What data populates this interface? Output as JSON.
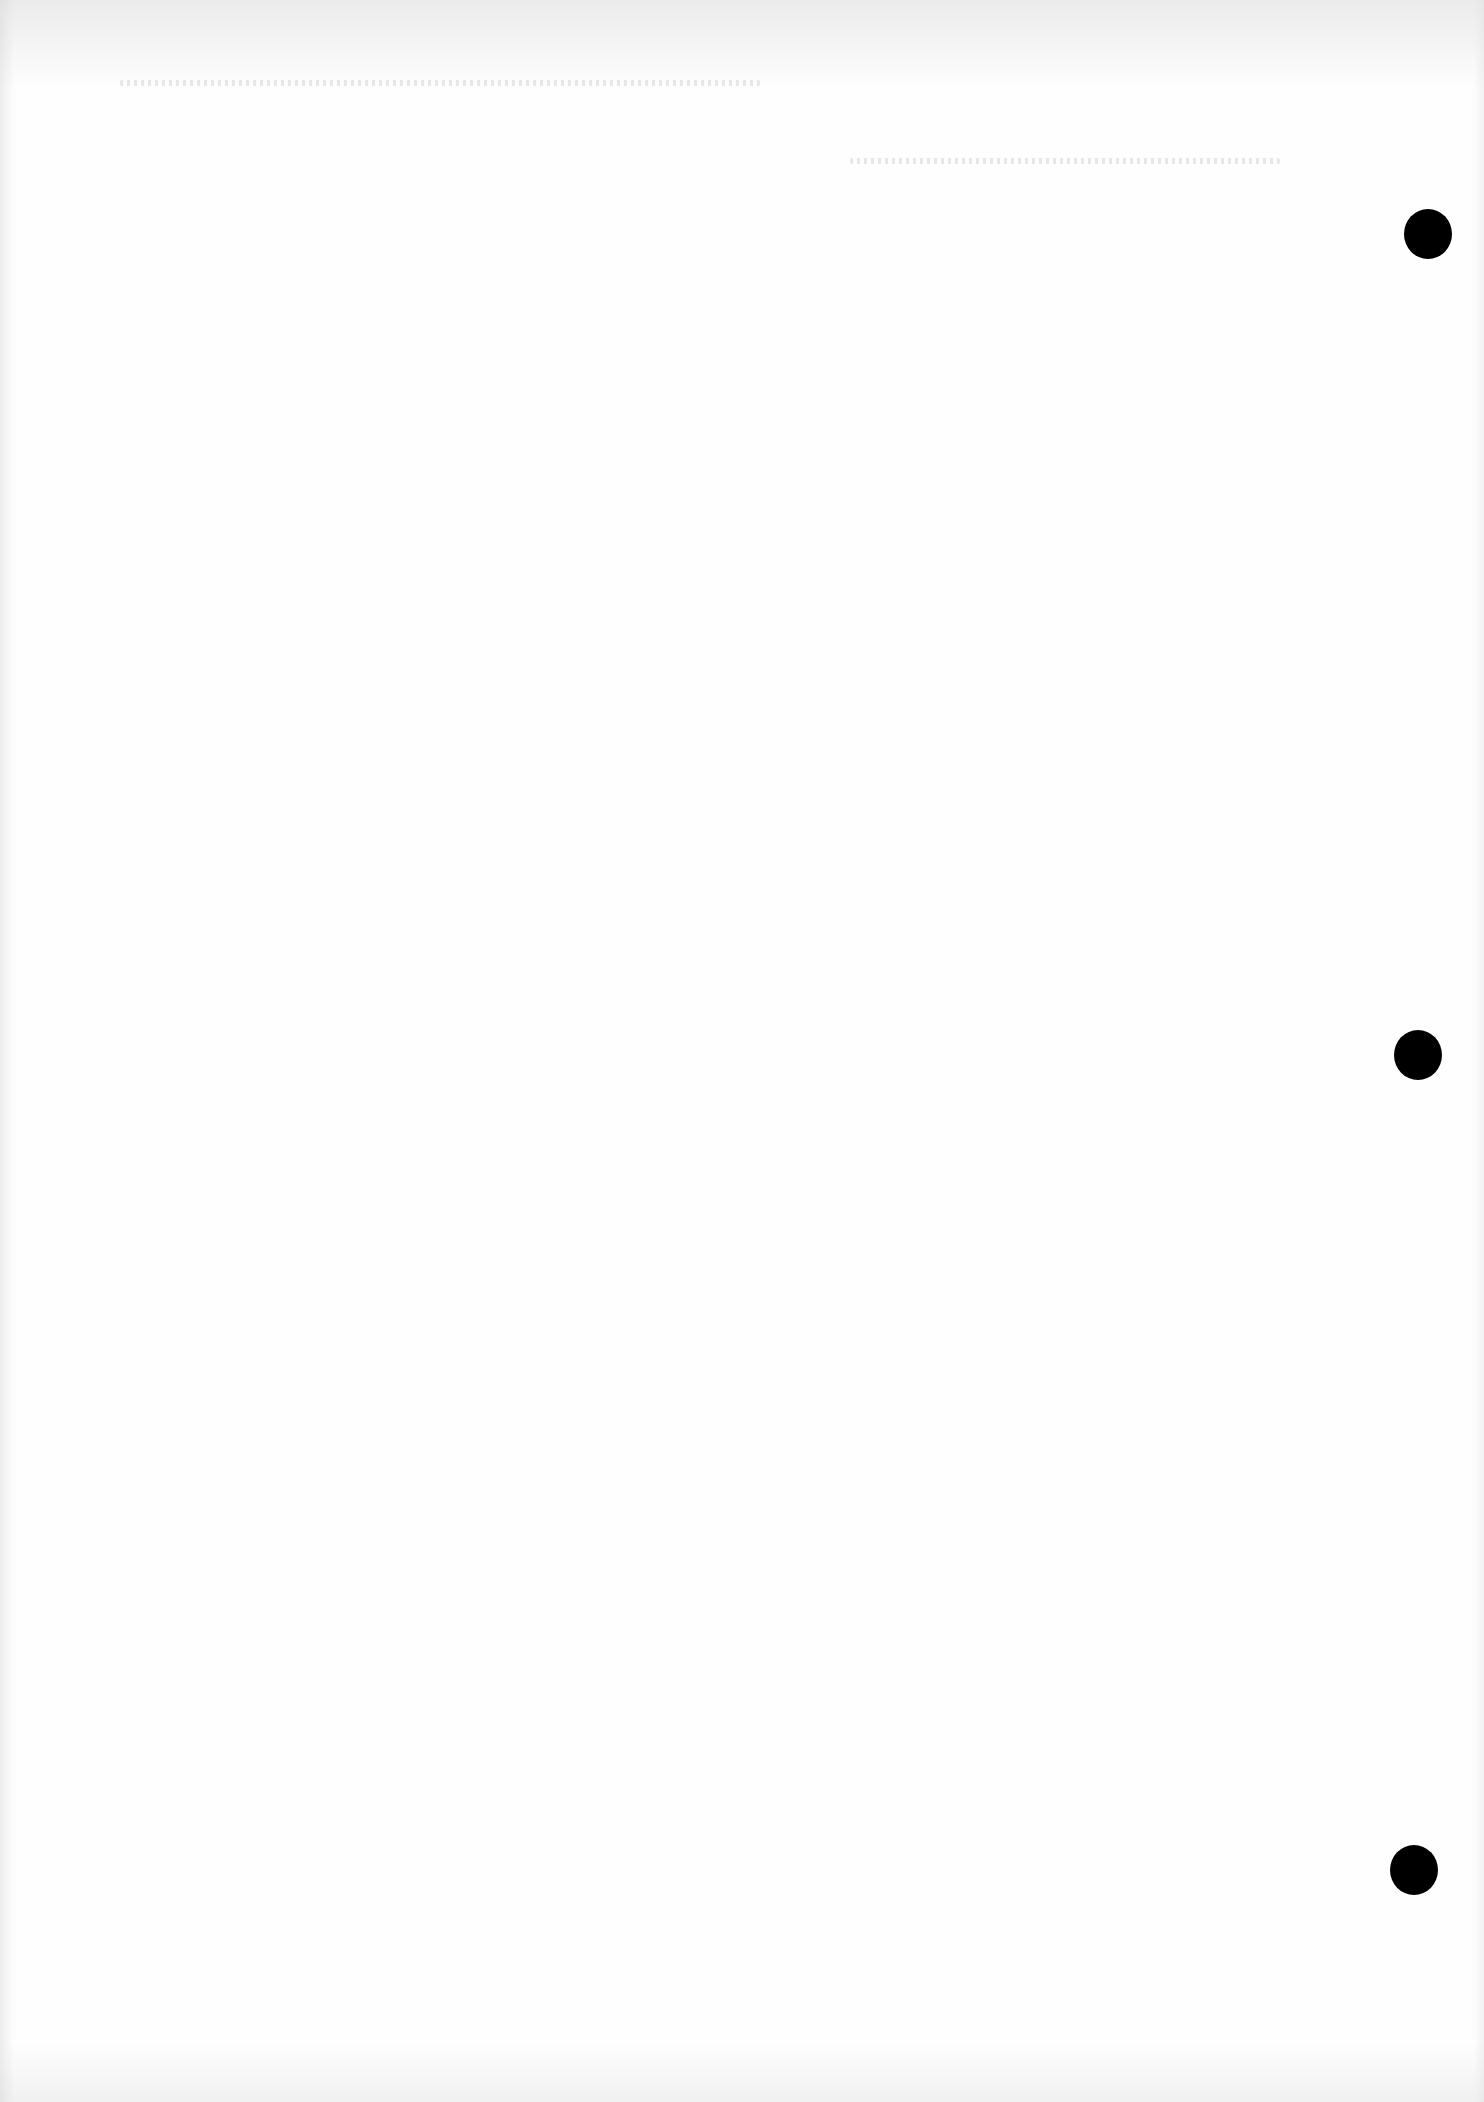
{
  "document": {
    "type": "blank scanned page",
    "background_color": "#fefefe",
    "punch_holes": [
      {
        "cx": 1428,
        "cy": 234
      },
      {
        "cx": 1418,
        "cy": 1055
      },
      {
        "cx": 1414,
        "cy": 1870
      }
    ],
    "punch_hole_color": "#000000"
  }
}
